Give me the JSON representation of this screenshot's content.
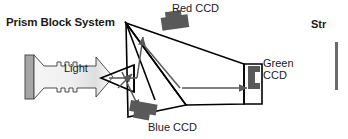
{
  "figure": {
    "title_label": "Prism Block System",
    "light_label": "Light",
    "sensors": {
      "red": "Red CCD",
      "green": "Green CCD",
      "green_line1": "Green",
      "green_line2": "CCD",
      "blue": "Blue CCD"
    },
    "right_panel_partial_text": "Str"
  },
  "colors": {
    "stroke": "#000000",
    "ray": "#595959",
    "sensor_body": "#595959",
    "light_body_light": "#f2f2f2",
    "light_body_mid": "#d9d9d9",
    "light_cap": "#a6a6a6",
    "panel_edge": "#808080",
    "text": "#1a1a1a",
    "background": "#ffffff"
  }
}
